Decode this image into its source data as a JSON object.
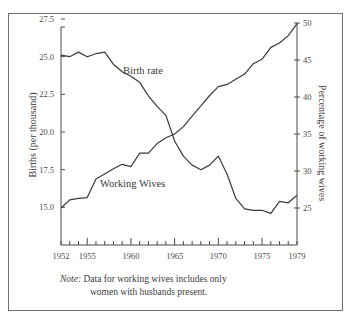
{
  "chart_data": {
    "type": "line",
    "title": "",
    "xlabel": "",
    "ylabel": "Births (per thousand)",
    "y2label": "Percentage of working wives",
    "x": [
      1952,
      1953,
      1954,
      1955,
      1956,
      1957,
      1958,
      1959,
      1960,
      1961,
      1962,
      1963,
      1964,
      1965,
      1966,
      1967,
      1968,
      1969,
      1970,
      1971,
      1972,
      1973,
      1974,
      1975,
      1976,
      1977,
      1978,
      1979
    ],
    "x_tick_labels": [
      "1952",
      "1955",
      "1960",
      "1965",
      "1970",
      "1975",
      "1979"
    ],
    "xlim": [
      1952,
      1979
    ],
    "ylim": [
      12.5,
      27.5
    ],
    "y_tick_labels": [
      "15.0",
      "17.5",
      "20.0",
      "22.5",
      "25.0",
      "27.5"
    ],
    "y2lim": [
      20,
      50
    ],
    "y2_tick_labels": [
      "25",
      "30",
      "35",
      "40",
      "45",
      "50"
    ],
    "grid": false,
    "legend_position": "inline labels",
    "series": [
      {
        "name": "Birth rate",
        "axis": "left",
        "values": [
          25.1,
          25.0,
          25.3,
          25.0,
          25.2,
          25.3,
          24.5,
          24.0,
          23.7,
          23.3,
          22.4,
          21.7,
          21.1,
          19.4,
          18.4,
          17.8,
          17.5,
          17.8,
          18.4,
          17.2,
          15.6,
          14.9,
          14.8,
          14.8,
          14.6,
          15.4,
          15.3,
          15.8
        ]
      },
      {
        "name": "Working Wives",
        "axis": "right",
        "values": [
          25.0,
          26.1,
          26.3,
          26.4,
          28.9,
          29.6,
          30.3,
          30.9,
          30.6,
          32.4,
          32.4,
          33.7,
          34.5,
          35.0,
          36.0,
          37.4,
          38.8,
          40.2,
          41.4,
          41.7,
          42.4,
          43.1,
          44.5,
          45.1,
          46.7,
          47.3,
          48.3,
          49.9
        ]
      }
    ],
    "annotations": [
      "Birth rate",
      "Working Wives"
    ]
  },
  "labels": {
    "left_axis_title": "Births (per thousand)",
    "right_axis_title": "Percentage of working wives",
    "birth_rate_label": "Birth rate",
    "working_wives_label": "Working Wives"
  },
  "note": {
    "lead": "Note:",
    "line1": " Data for working wives includes only",
    "line2": "women with husbands present."
  },
  "colors": {
    "line": "#3a3a3a",
    "axis": "#4a4a4a",
    "frame": "#6e6e6e"
  }
}
